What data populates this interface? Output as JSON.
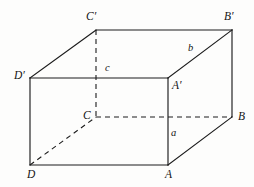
{
  "figure": {
    "kind": "cuboid-oblique-projection",
    "width": 254,
    "height": 187,
    "background_color": "#fdfdfc",
    "line_color": "#1c1c1c",
    "vertices": {
      "D_prime": {
        "label": "D′",
        "x": 30,
        "y": 78,
        "visible": true
      },
      "A_prime": {
        "label": "A′",
        "x": 168,
        "y": 78,
        "visible": true
      },
      "C_prime": {
        "label": "C′",
        "x": 96,
        "y": 30,
        "visible": true
      },
      "B_prime": {
        "label": "B′",
        "x": 232,
        "y": 30,
        "visible": true
      },
      "D": {
        "label": "D",
        "x": 30,
        "y": 165,
        "visible": true
      },
      "A": {
        "label": "A",
        "x": 168,
        "y": 165,
        "visible": true
      },
      "C": {
        "label": "C",
        "x": 96,
        "y": 117,
        "visible": false
      },
      "B": {
        "label": "B",
        "x": 232,
        "y": 117,
        "visible": true
      }
    },
    "edge_labels": {
      "a": {
        "label": "a",
        "edge": "A-A′",
        "x": 171,
        "y": 132
      },
      "b": {
        "label": "b",
        "edge": "A′-B′",
        "x": 188,
        "y": 45
      },
      "c": {
        "label": "c",
        "edge": "C′-C",
        "x": 106,
        "y": 65
      }
    },
    "solid_edges": [
      {
        "name": "front-top",
        "from": "D_prime",
        "to": "A_prime"
      },
      {
        "name": "front-right",
        "from": "A_prime",
        "to": "A"
      },
      {
        "name": "front-bottom",
        "from": "A",
        "to": "D"
      },
      {
        "name": "front-left",
        "from": "D",
        "to": "D_prime"
      },
      {
        "name": "top-back",
        "from": "C_prime",
        "to": "B_prime"
      },
      {
        "name": "top-left-receding",
        "from": "D_prime",
        "to": "C_prime"
      },
      {
        "name": "top-right-receding",
        "from": "A_prime",
        "to": "B_prime"
      },
      {
        "name": "back-right-vertical",
        "from": "B_prime",
        "to": "B"
      },
      {
        "name": "bottom-right-receding",
        "from": "A",
        "to": "B"
      }
    ],
    "hidden_edges": [
      {
        "name": "hidden-vertical-C",
        "from": "C_prime",
        "to": "C"
      },
      {
        "name": "hidden-back-bottom",
        "from": "C",
        "to": "B"
      },
      {
        "name": "hidden-bottom-receding",
        "from": "D",
        "to": "C"
      }
    ]
  }
}
